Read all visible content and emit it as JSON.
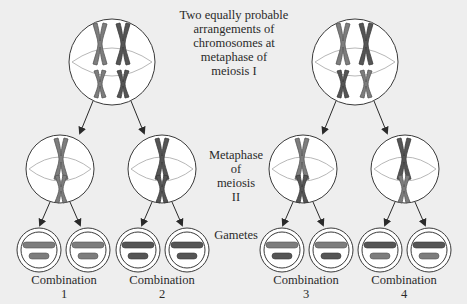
{
  "title_label": {
    "lines": [
      "Two equally probable",
      "arrangements of",
      "chromosomes at",
      "metaphase of",
      "meiosis I"
    ]
  },
  "meiosis2_label": {
    "lines": [
      "Metaphase",
      "of",
      "meiosis",
      "II"
    ]
  },
  "gametes_label": "Gametes",
  "combinations": [
    {
      "label": "Combination",
      "number": "1"
    },
    {
      "label": "Combination",
      "number": "2"
    },
    {
      "label": "Combination",
      "number": "3"
    },
    {
      "label": "Combination",
      "number": "4"
    }
  ],
  "colors": {
    "background": "#eeeeee",
    "cell_fill": "#ffffff",
    "cell_outline": "#3a3a3a",
    "spindle": "#b8b8b8",
    "chromosome_light": "#7d7d7d",
    "chromosome_dark": "#555555",
    "arrow": "#2a2a2a"
  }
}
